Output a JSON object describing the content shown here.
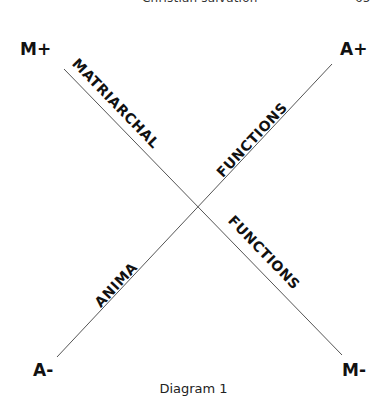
{
  "header": {
    "running_title": "Christian salvation",
    "page_number": "65"
  },
  "diagram": {
    "poles": {
      "top_left": "M+",
      "top_right": "A+",
      "bottom_left": "A-",
      "bottom_right": "M-"
    },
    "axis_labels": {
      "upper_left_arm": "MATRIARCHAL",
      "upper_right_arm": "FUNCTIONS",
      "lower_left_arm": "ANIMA",
      "lower_right_arm": "FUNCTIONS"
    },
    "lines": [
      {
        "name": "matriarchal-axis",
        "from": "M+",
        "to": "M-"
      },
      {
        "name": "anima-axis",
        "from": "A-",
        "to": "A+"
      }
    ],
    "line_color": "#555555",
    "text_color": "#111111"
  },
  "caption": "Diagram 1"
}
